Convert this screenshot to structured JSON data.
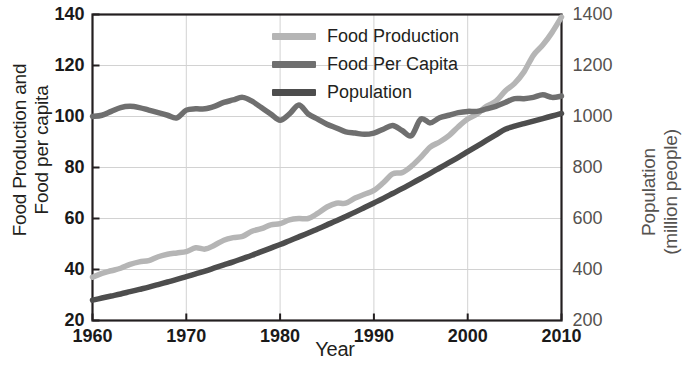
{
  "chart_data": {
    "type": "line",
    "title": "",
    "xlabel": "Year",
    "ylabel": "Food Production and Food per capita",
    "ylabel_line1": "Food Production and",
    "ylabel_line2": "Food per capita",
    "y2label": "Population (million people)",
    "y2label_line1": "Population",
    "y2label_line2": "(million people)",
    "xlim": [
      1960,
      2010
    ],
    "ylim": [
      20,
      140
    ],
    "y2lim": [
      200,
      1400
    ],
    "xticks": [
      1960,
      1970,
      1980,
      1990,
      2000,
      2010
    ],
    "xticklabels": [
      "1960",
      "1970",
      "1980",
      "1990",
      "2000",
      "2010"
    ],
    "yticks": [
      20,
      40,
      60,
      80,
      100,
      120,
      140
    ],
    "yticklabels": [
      "20",
      "40",
      "60",
      "80",
      "100",
      "120",
      "140"
    ],
    "y2ticks": [
      200,
      400,
      600,
      800,
      1000,
      1200,
      1400
    ],
    "y2ticklabels": [
      "200",
      "400",
      "600",
      "800",
      "1000",
      "1200",
      "1400"
    ],
    "grid": true,
    "legend_position": "top-center",
    "colors": {
      "food_production": "#b5b5b5",
      "food_per_capita": "#6f6f6f",
      "population": "#4d4d4d",
      "grid": "#d2d2d2",
      "frame": "#231f20",
      "background": "#ffffff"
    },
    "x": [
      1960,
      1961,
      1962,
      1963,
      1964,
      1965,
      1966,
      1967,
      1968,
      1969,
      1970,
      1971,
      1972,
      1973,
      1974,
      1975,
      1976,
      1977,
      1978,
      1979,
      1980,
      1981,
      1982,
      1983,
      1984,
      1985,
      1986,
      1987,
      1988,
      1989,
      1990,
      1991,
      1992,
      1993,
      1994,
      1995,
      1996,
      1997,
      1998,
      1999,
      2000,
      2001,
      2002,
      2003,
      2004,
      2005,
      2006,
      2007,
      2008,
      2009,
      2010
    ],
    "series": [
      {
        "name": "Food Production",
        "axis": "left",
        "color": "#b5b5b5",
        "values": [
          37,
          38.5,
          39.5,
          40.5,
          42,
          43,
          43.5,
          45,
          46,
          46.5,
          47,
          48.5,
          48,
          49.5,
          51.5,
          52.5,
          53,
          55,
          56,
          57.5,
          58,
          59.5,
          60,
          60,
          62,
          64.5,
          66,
          66,
          68,
          69.5,
          71,
          74,
          77.5,
          78,
          80.5,
          84,
          88,
          90,
          92.5,
          96,
          99,
          101,
          104,
          106,
          110,
          113,
          117.5,
          124,
          128,
          133,
          139
        ]
      },
      {
        "name": "Food Per Capita",
        "axis": "left",
        "color": "#6f6f6f",
        "values": [
          100,
          100.5,
          102,
          103.5,
          104,
          103.5,
          102.5,
          101.5,
          100.5,
          99.5,
          102.5,
          103,
          103,
          104,
          105.5,
          106.5,
          107.5,
          106,
          103.5,
          101,
          98.5,
          101,
          104.5,
          101,
          99,
          97,
          95.5,
          94,
          93.5,
          93,
          93.5,
          95,
          96.5,
          94.5,
          92.5,
          99,
          97.5,
          99.5,
          100.5,
          101.5,
          102,
          102,
          103,
          104,
          105.5,
          107,
          107,
          107.5,
          108.5,
          107.5,
          108
        ]
      },
      {
        "name": "Population",
        "axis": "right",
        "color": "#4d4d4d",
        "values_right_scale": [
          280,
          288,
          296,
          304,
          313,
          322,
          331,
          341,
          351,
          361,
          372,
          383,
          394,
          406,
          418,
          430,
          443,
          456,
          470,
          484,
          498,
          513,
          528,
          543,
          559,
          575,
          591,
          608,
          625,
          643,
          661,
          679,
          698,
          717,
          737,
          757,
          777,
          798,
          819,
          840,
          862,
          884,
          906,
          928,
          950,
          962,
          972,
          982,
          992,
          1002,
          1012
        ],
        "values": [
          28,
          28.8,
          29.6,
          30.4,
          31.3,
          32.2,
          33.1,
          34.1,
          35.1,
          36.1,
          37.2,
          38.3,
          39.4,
          40.6,
          41.8,
          43,
          44.3,
          45.6,
          47,
          48.4,
          49.8,
          51.3,
          52.8,
          54.3,
          55.9,
          57.5,
          59.1,
          60.8,
          62.5,
          64.3,
          66.1,
          67.9,
          69.8,
          71.7,
          73.7,
          75.7,
          77.7,
          79.8,
          81.9,
          84,
          86.2,
          88.4,
          90.6,
          92.8,
          95,
          96.2,
          97.2,
          98.2,
          99.2,
          100.2,
          101.2
        ]
      }
    ]
  },
  "legend": {
    "items": [
      {
        "label": "Food Production",
        "color": "#b5b5b5"
      },
      {
        "label": "Food Per Capita",
        "color": "#6f6f6f"
      },
      {
        "label": "Population",
        "color": "#4d4d4d"
      }
    ]
  }
}
